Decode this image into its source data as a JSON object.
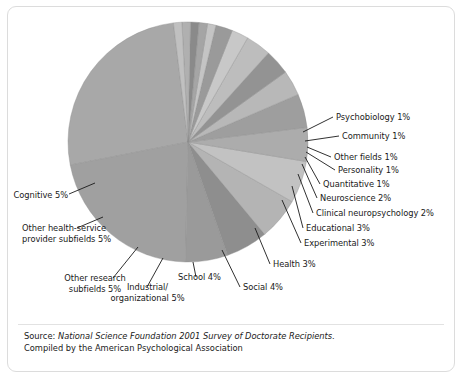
{
  "chart_data": {
    "type": "pie",
    "title": "",
    "xlabel": "",
    "ylabel": "",
    "legend_position": "callout-labels",
    "grid": false,
    "units": "percent",
    "center": {
      "cx": 188,
      "cy": 142,
      "r": 120
    },
    "slices": [
      {
        "label": "",
        "value": 23,
        "display": "",
        "color": "#a8a8a8",
        "labeled": false
      },
      {
        "label": "",
        "value": 19,
        "display": "",
        "color": "#a0a0a0",
        "labeled": false
      },
      {
        "label": "Cognitive",
        "value": 5,
        "display": "Cognitive 5%",
        "color": "#9a9a9a",
        "labeled": true
      },
      {
        "label": "Other health-service provider subfields",
        "value": 5,
        "display": "Other health-service provider subfields 5%",
        "color": "#8e8e8e",
        "labeled": true
      },
      {
        "label": "Other research subfields",
        "value": 5,
        "display": "Other research subfields 5%",
        "color": "#b4b4b4",
        "labeled": true
      },
      {
        "label": "Industrial/organizational",
        "value": 5,
        "display": "Industrial/ organizational 5%",
        "color": "#c2c2c2",
        "labeled": true
      },
      {
        "label": "School",
        "value": 4,
        "display": "School 4%",
        "color": "#acacac",
        "labeled": true
      },
      {
        "label": "Social",
        "value": 4,
        "display": "Social 4%",
        "color": "#9e9e9e",
        "labeled": true
      },
      {
        "label": "Health",
        "value": 3,
        "display": "Health 3%",
        "color": "#b8b8b8",
        "labeled": true
      },
      {
        "label": "Experimental",
        "value": 3,
        "display": "Experimental 3%",
        "color": "#939393",
        "labeled": true
      },
      {
        "label": "Educational",
        "value": 3,
        "display": "Educational 3%",
        "color": "#bdbdbd",
        "labeled": true
      },
      {
        "label": "Clinical neuropsychology",
        "value": 2,
        "display": "Clinical neuropsychology 2%",
        "color": "#c8c8c8",
        "labeled": true
      },
      {
        "label": "Neuroscience",
        "value": 2,
        "display": "Neuroscience 2%",
        "color": "#9a9a9a",
        "labeled": true
      },
      {
        "label": "Quantitative",
        "value": 1,
        "display": "Quantitative 1%",
        "color": "#c4c4c4",
        "labeled": true
      },
      {
        "label": "Personality",
        "value": 1,
        "display": "Personality 1%",
        "color": "#a5a5a5",
        "labeled": true
      },
      {
        "label": "Other fields",
        "value": 1,
        "display": "Other fields 1%",
        "color": "#8a8a8a",
        "labeled": true
      },
      {
        "label": "Community",
        "value": 1,
        "display": "Community 1%",
        "color": "#b0b0b0",
        "labeled": true
      },
      {
        "label": "Psychobiology",
        "value": 1,
        "display": "Psychobiology 1%",
        "color": "#c0c0c0",
        "labeled": true
      }
    ]
  },
  "labels": {
    "psychobiology": "Psychobiology 1%",
    "community": "Community 1%",
    "other_fields": "Other fields 1%",
    "personality": "Personality 1%",
    "quantitative": "Quantitative 1%",
    "neuroscience": "Neuroscience 2%",
    "clinical_neuropsychology": "Clinical neuropsychology 2%",
    "educational": "Educational 3%",
    "experimental": "Experimental 3%",
    "health": "Health 3%",
    "social": "Social 4%",
    "school": "School 4%",
    "industrial_line1": "Industrial/",
    "industrial_line2": "organizational 5%",
    "other_research_line1": "Other research",
    "other_research_line2": "subfields 5%",
    "other_health_line1": "Other health-service",
    "other_health_line2": "provider subfields 5%",
    "cognitive": "Cognitive 5%"
  },
  "source": {
    "prefix": "Source: ",
    "italic": "National Science Foundation 2001 Survey of Doctorate Recipients.",
    "line2": "Compiled by the American Psychological Association"
  },
  "colors": {
    "border": "#dcdcdc",
    "text": "#1a1a1a",
    "background": "#ffffff",
    "leader": "#1a1a1a"
  }
}
